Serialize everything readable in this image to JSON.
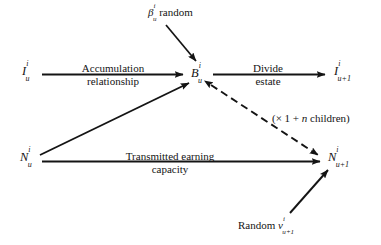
{
  "figure": {
    "type": "flow-diagram",
    "background_color": "#ffffff",
    "ink_color": "#141414",
    "width": 381,
    "height": 245
  },
  "nodes": [
    {
      "id": "I_u",
      "name": "node-I-u",
      "base": "I",
      "sup": "i",
      "sub": "u",
      "x": 22,
      "y": 64
    },
    {
      "id": "B_u",
      "name": "node-B-u",
      "base": "B",
      "sup": "i",
      "sub": "u",
      "x": 191,
      "y": 66
    },
    {
      "id": "I_u1",
      "name": "node-I-u-plus-1",
      "base": "I",
      "sup": "i",
      "sub": "u+1",
      "x": 334,
      "y": 64
    },
    {
      "id": "N_u",
      "name": "node-N-u",
      "base": "N",
      "sup": "i",
      "sub": "u",
      "x": 20,
      "y": 150
    },
    {
      "id": "N_u1",
      "name": "node-N-u-plus-1",
      "base": "N",
      "sup": "i",
      "sub": "u+1",
      "x": 328,
      "y": 150
    }
  ],
  "labels": {
    "beta_random": {
      "base": "β",
      "sup": "i",
      "sub": "u",
      "text": "random",
      "full": "βᵤⁱ random",
      "x": 148,
      "y": 6
    },
    "accumulation": {
      "line1": "Accumulation",
      "line2": "relationship",
      "x": 68,
      "y": 62
    },
    "divide_estate": {
      "line1": "Divide",
      "line2": "estate",
      "x": 243,
      "y": 62
    },
    "children_note": {
      "open": "(× 1 + ",
      "var": "n",
      "close": " children)",
      "full": "(× 1 + n children)",
      "x": 272,
      "y": 112
    },
    "transmitted": {
      "line1": "Transmitted earning",
      "line2": "capacity",
      "x": 104,
      "y": 150
    },
    "random_nu": {
      "text": "Random",
      "base": "ν",
      "sup": "i",
      "sub": "u+1",
      "full": "Random νᵤ₊₁ⁱ",
      "x": 238,
      "y": 219
    }
  },
  "edges": [
    {
      "name": "edge-I-u-to-B-u",
      "style": "solid",
      "arrow": "end",
      "from": "I_u",
      "to": "B_u",
      "label": "accumulation"
    },
    {
      "name": "edge-B-u-to-I-u-plus-1",
      "style": "solid",
      "arrow": "end",
      "from": "B_u",
      "to": "I_u1",
      "label": "divide_estate"
    },
    {
      "name": "edge-beta-to-B-u",
      "style": "solid",
      "arrow": "end",
      "from": "beta_random",
      "to": "B_u",
      "label": null
    },
    {
      "name": "edge-N-u-to-B-u",
      "style": "solid",
      "arrow": "end",
      "from": "N_u",
      "to": "B_u",
      "label": null
    },
    {
      "name": "edge-N-u-to-N-u-plus-1",
      "style": "solid",
      "arrow": "end",
      "from": "N_u",
      "to": "N_u1",
      "label": "transmitted"
    },
    {
      "name": "edge-B-u-to-N-u-plus-1-dashed",
      "style": "dashed",
      "arrow": "both",
      "from": "B_u",
      "to": "N_u1",
      "label": "children_note"
    },
    {
      "name": "edge-random-nu-to-N-u-plus-1",
      "style": "solid",
      "arrow": "end",
      "from": "random_nu",
      "to": "N_u1",
      "label": null
    }
  ]
}
